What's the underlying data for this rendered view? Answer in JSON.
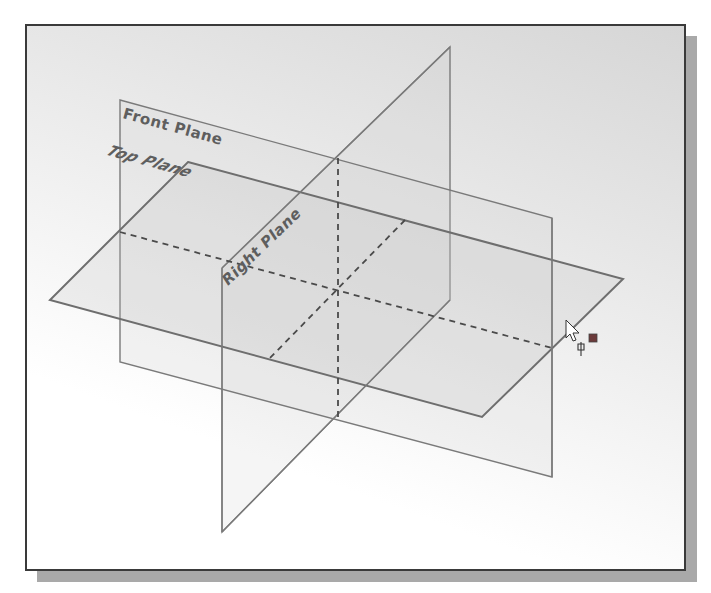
{
  "viewport": {
    "background_top": "#d6d6d6",
    "background_bottom": "#ffffff",
    "border_color": "#3a3a3a",
    "shadow_color": "#a9a9a9"
  },
  "planes": {
    "front": {
      "label": "Front Plane",
      "edge_color": "#7a7a7a",
      "fill": "rgba(200,200,200,0.18)"
    },
    "top": {
      "label": "Top Plane",
      "edge_color": "#707070",
      "fill": "rgba(190,190,190,0.25)"
    },
    "right": {
      "label": "Right Plane",
      "edge_color": "#7a7a7a",
      "fill": "rgba(200,200,200,0.18)"
    }
  },
  "cursor": {
    "icon": "arrow-pointer-icon",
    "badge_icon": "plane-select-icon",
    "badge_color": "#6b3a3a"
  }
}
